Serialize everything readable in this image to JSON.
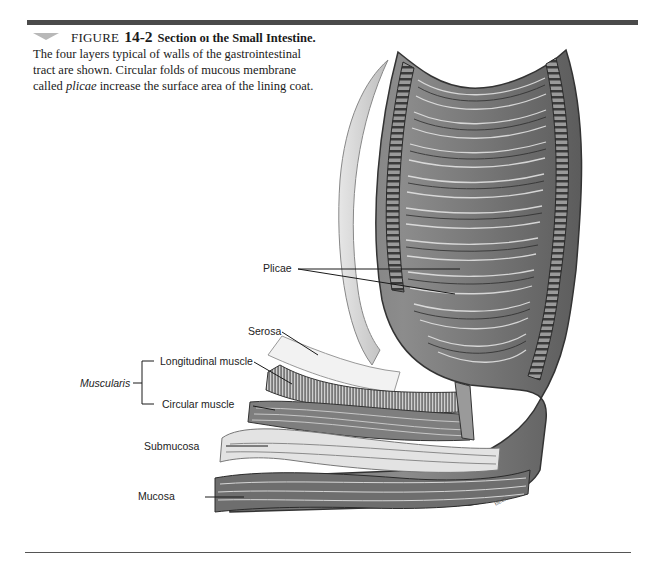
{
  "figure": {
    "label": "FIGURE",
    "number": "14-2",
    "title": "Section oı the Small Intestine.",
    "caption_lines": [
      "The four layers typical of walls of the gastrointestinal",
      "tract are shown. Circular folds of mucous membrane"
    ],
    "caption_last_prefix": "called ",
    "caption_last_term": "plicae",
    "caption_last_suffix": " increase the surface area of the lining coat."
  },
  "labels": {
    "plicae": "Plicae",
    "serosa": "Serosa",
    "longitudinal_muscle": "Longitudinal muscle",
    "muscularis": "Muscularis",
    "circular_muscle": "Circular muscle",
    "submucosa": "Submucosa",
    "mucosa": "Mucosa"
  },
  "signature": "Beck",
  "colors": {
    "rule": "#4a4a4a",
    "marker": "#b8b8b8",
    "tissue_dark": "#5a5a5a",
    "tissue_mid": "#8a8a8a",
    "tissue_light": "#d8d8d8"
  }
}
